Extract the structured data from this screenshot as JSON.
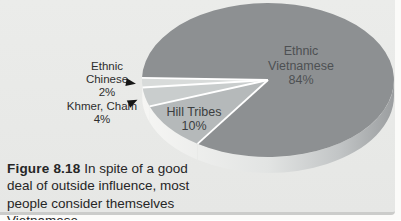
{
  "page": {
    "background_color": "#fbfbf9",
    "panel_color": "#e8e9e7",
    "panel_edge_color": "#cbccca"
  },
  "chart_data": {
    "type": "pie",
    "title": "",
    "style": "3d-ellipse",
    "legend_position": "labels-on-and-beside-slices",
    "start_angle_deg": 178.4,
    "categories": [
      "Ethnic Chinese",
      "Khmer, Cham",
      "Hill Tribes",
      "Ethnic Vietnamese"
    ],
    "values": [
      2,
      4,
      10,
      84
    ],
    "slices": [
      {
        "label": "Ethnic Chinese",
        "value": 2,
        "pct_label": "2%",
        "color": "#d8dbda"
      },
      {
        "label": "Khmer, Cham",
        "value": 4,
        "pct_label": "4%",
        "color": "#c9cdcd"
      },
      {
        "label": "Hill Tribes",
        "value": 10,
        "pct_label": "10%",
        "color": "#b5b9ba"
      },
      {
        "label": "Ethnic Vietnamese",
        "value": 84,
        "pct_label": "84%",
        "color": "#8d9092"
      }
    ],
    "wall_color": "#d0d3d2",
    "rim_gradient": [
      "#f6f6f4",
      "#e2e4e3",
      "#c2c5c6",
      "#9b9ea0"
    ],
    "separator_color": "#ffffff"
  },
  "labels": {
    "vietnamese": {
      "lines": [
        "Ethnic",
        "Vietnamese",
        "84%"
      ]
    },
    "hill": {
      "lines": [
        "Hill Tribes",
        "10%"
      ]
    },
    "chinese": {
      "lines": [
        "Ethnic",
        "Chinese",
        "2%"
      ]
    },
    "khmer": {
      "lines": [
        "Khmer, Cham",
        "4%"
      ]
    }
  },
  "icons": {
    "pointer_arrow": "css-triangle-right"
  },
  "caption": {
    "figure_label": "Figure 8.18",
    "text": "In spite of a good deal of outside influence, most people consider themselves Vietnamese."
  }
}
